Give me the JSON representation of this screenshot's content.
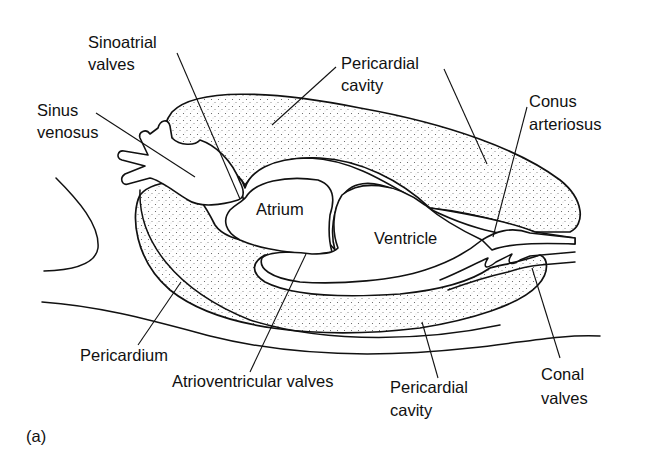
{
  "figure": {
    "panel_label": "(a)",
    "labels": {
      "sinoatrial_valves": [
        "Sinoatrial",
        "valves"
      ],
      "pericardial_cavity_top": [
        "Pericardial",
        "cavity"
      ],
      "sinus_venosus": [
        "Sinus",
        "venosus"
      ],
      "conus_arteriosus": [
        "Conus",
        "arteriosus"
      ],
      "atrium": "Atrium",
      "ventricle": "Ventricle",
      "pericardium": "Pericardium",
      "atrioventricular_valves": "Atrioventricular valves",
      "pericardial_cavity_bottom": [
        "Pericardial",
        "cavity"
      ],
      "conal_valves": [
        "Conal",
        "valves"
      ]
    },
    "colors": {
      "ink": "#111111",
      "background": "#ffffff",
      "stipple": "#555555"
    }
  }
}
